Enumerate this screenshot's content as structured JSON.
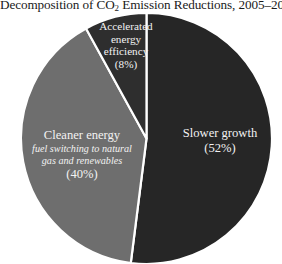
{
  "title": {
    "prefix": "Decomposition of CO",
    "subscript": "2",
    "suffix": " Emission Reductions, 2005–2012",
    "full": "Decomposition of CO2 Emission Reductions, 2005–2012"
  },
  "chart_data": {
    "type": "pie",
    "title": "Decomposition of CO2 Emission Reductions, 2005–2012",
    "xlabel": "",
    "ylabel": "",
    "legend_position": "none",
    "grid": false,
    "units": "percent",
    "start_angle_deg": 0,
    "direction": "clockwise",
    "categories": [
      "Slower growth",
      "Cleaner energy",
      "Accelerated energy efficiency"
    ],
    "values": [
      52,
      40,
      8
    ],
    "labels": [
      "Slower growth",
      "Cleaner energy",
      "Accelerated energy efficiency"
    ],
    "value_labels": [
      "(52%)",
      "(40%)",
      "(8%)"
    ],
    "colors": [
      "#262626",
      "#6e6e6e",
      "#2e2e2e"
    ],
    "slices": [
      {
        "name": "Slower growth",
        "value": 52,
        "value_label": "(52%)",
        "color": "#262626",
        "text_color": "#f2f2f2",
        "annotation": ""
      },
      {
        "name": "Cleaner energy",
        "value": 40,
        "value_label": "(40%)",
        "color": "#6e6e6e",
        "text_color": "#f2f2f2",
        "annotation": "fuel switching to natural gas and renewables"
      },
      {
        "name": "Accelerated energy efficiency",
        "value": 8,
        "value_label": "(8%)",
        "color": "#2e2e2e",
        "text_color": "#f2f2f2",
        "annotation": ""
      }
    ]
  },
  "slice_labels": {
    "slower_growth": {
      "title": "Slower growth",
      "percent": "(52%)"
    },
    "cleaner_energy": {
      "title": "Cleaner energy",
      "note_line1": "fuel switching to natural",
      "note_line2": "gas and renewables",
      "percent": "(40%)"
    },
    "energy_efficiency": {
      "title_line1": "Accelerated",
      "title_line2": "energy",
      "title_line3": "efficiency",
      "percent": "(8%)"
    }
  },
  "colors": {
    "background": "#ffffff",
    "slice_slower_growth": "#262626",
    "slice_cleaner_energy": "#6e6e6e",
    "slice_energy_efficiency": "#2e2e2e",
    "separator": "#ffffff",
    "label_text": "#f2f2f2",
    "title_text": "#1a1a1a"
  }
}
